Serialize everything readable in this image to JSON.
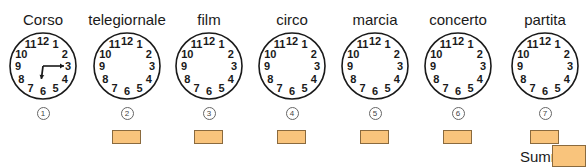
{
  "header": {
    "cropped_text": ""
  },
  "clocks": [
    {
      "label": "Corso",
      "number": "1",
      "hour_hand_deg": 187,
      "minute_hand_deg": 90,
      "has_hands": true,
      "has_answer_box": false
    },
    {
      "label": "telegiornale",
      "number": "2",
      "has_hands": false,
      "has_answer_box": true
    },
    {
      "label": "film",
      "number": "3",
      "has_hands": false,
      "has_answer_box": true
    },
    {
      "label": "circo",
      "number": "4",
      "has_hands": false,
      "has_answer_box": true
    },
    {
      "label": "marcia",
      "number": "5",
      "has_hands": false,
      "has_answer_box": true
    },
    {
      "label": "concerto",
      "number": "6",
      "has_hands": false,
      "has_answer_box": true
    },
    {
      "label": "partita",
      "number": "7",
      "has_hands": false,
      "has_answer_box": true
    }
  ],
  "dial_numbers": [
    "12",
    "1",
    "2",
    "3",
    "4",
    "5",
    "6",
    "7",
    "8",
    "9",
    "10",
    "11"
  ],
  "summe": {
    "label": "Summe:",
    "value": ""
  },
  "colors": {
    "answer_box": "#f9c47c",
    "answer_border": "#8a6a3e"
  }
}
